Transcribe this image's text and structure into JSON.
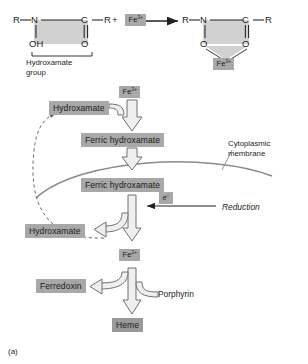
{
  "figure": {
    "panel_label": "(a)",
    "caption_hydroxamate": "Hydroxamate",
    "caption_group": "group"
  },
  "reaction": {
    "reactant": {
      "r_left": "R",
      "n": "N",
      "c": "C",
      "r_right": "R",
      "oh": "OH",
      "o": "O",
      "plus": "+"
    },
    "iron_reactant": "Fe3+",
    "arrow": "reaction-arrow",
    "product": {
      "r_left": "R",
      "n": "N",
      "c": "C",
      "r_right": "R",
      "o_left": "O",
      "o_right": "O",
      "iron": "Fe3+"
    }
  },
  "pathway": {
    "iron_input": "Fe3+",
    "hydroxamate_out": "Hydroxamate",
    "ferric_hydroxamate_outside": "Ferric hydroxamate",
    "membrane_label": "Cytoplasmic membrane",
    "ferric_hydroxamate_inside": "Ferric hydroxamate",
    "electron": "e-",
    "reduction": "Reduction",
    "hydroxamate_released": "Hydroxamate",
    "ferrous_iron": "Fe2+",
    "ferredoxin": "Ferredoxin",
    "porphyrin": "Porphyrin",
    "heme": "Heme"
  },
  "colors": {
    "highlight": "#a8a8a8",
    "highlight_light": "#b9b9b9",
    "highlight_dark": "#9a9a9a",
    "arrow_fill": "#e8e8e8",
    "arrow_stroke": "#6e6e6e",
    "membrane": "#8a8a8a",
    "ink": "#231f20"
  }
}
